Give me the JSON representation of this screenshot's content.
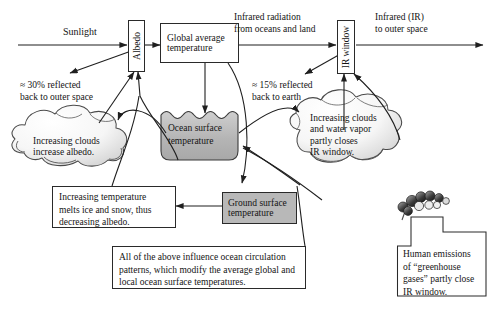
{
  "diagram": {
    "nodes": {
      "albedo": {
        "label": "Albedo",
        "orientation": "vertical"
      },
      "global_average_temperature": {
        "label": "Global average\ntemperature",
        "line1": "Global average",
        "line2": "temperature"
      },
      "ir_window": {
        "label": "IR window",
        "orientation": "vertical"
      },
      "ocean_surface_temperature": {
        "line1": "Ocean surface",
        "line2": "temperature",
        "fill": "#b8b8b8"
      },
      "ground_surface_temperature": {
        "line1": "Ground surface",
        "line2": "temperature",
        "fill": "#b8b8b8"
      }
    },
    "flow_labels": {
      "sunlight": "Sunlight",
      "infrared_radiation": "Infrared radiation\nfrom oceans and land",
      "infrared_radiation_l1": "Infrared radiation",
      "infrared_radiation_l2": "from oceans and land",
      "infrared_to_space_l1": "Infrared (IR)",
      "infrared_to_space_l2": "to outer space",
      "reflected_space_l1": "≈ 30% reflected",
      "reflected_space_l2": "back to outer space",
      "reflected_earth_l1": "≈ 15% reflected",
      "reflected_earth_l2": "back to earth"
    },
    "clouds": {
      "left": {
        "line1": "Increasing clouds",
        "line2": "increase albedo."
      },
      "right": {
        "line1": "Increasing clouds",
        "line2": "and water vapor",
        "line3": "partly closes",
        "line4": "IR window."
      }
    },
    "textboxes": {
      "albedo_feedback": {
        "line1": "Increasing temperature",
        "line2": "melts ice and snow, thus",
        "line3": "decreasing albedo."
      },
      "ocean_circulation": {
        "line1": "All of the above influence ocean circulation",
        "line2": "patterns, which modify the average global and",
        "line3": "local ocean surface temperatures."
      },
      "human_emissions": {
        "line1": "Human emissions",
        "line2": "of “greenhouse",
        "line3": "gases” partly close",
        "line4": "IR window."
      }
    },
    "icons": {
      "smoke_plume": "smoke-plume-icon",
      "cloud_left": "cloud-icon",
      "cloud_right": "cloud-icon"
    },
    "colors": {
      "line": "#2a2a2a",
      "shaded_fill": "#b8b8b8",
      "cloud_fill": "#f2f2f2",
      "background": "#ffffff",
      "text": "#141414"
    }
  }
}
